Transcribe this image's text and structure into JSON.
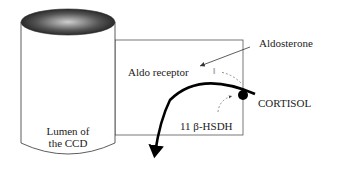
{
  "diagram": {
    "cylinder_label_line1": "Lumen of",
    "cylinder_label_line2": "the CCD",
    "aldosterone": "Aldosterone",
    "aldo_receptor": "Aldo receptor",
    "cortisol": "CORTISOL",
    "enzyme": "11 β-HSDH",
    "blocked_symbol": "‖",
    "colors": {
      "line": "#333333",
      "box": "#555555",
      "dashed": "#777777",
      "arrow": "#000000"
    }
  }
}
